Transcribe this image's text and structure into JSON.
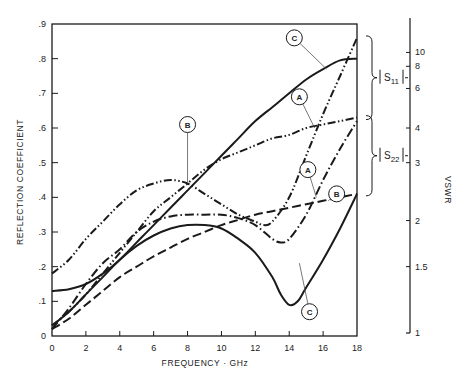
{
  "chart_data": {
    "type": "line",
    "title": "",
    "xlabel": "FREQUENCY · GHz",
    "ylabel": "REFLECTION COEFFICIENT",
    "y2label": "VSWR",
    "xlim": [
      0,
      18
    ],
    "ylim": [
      0,
      0.9
    ],
    "grid": false,
    "x_ticks": [
      0,
      2,
      4,
      6,
      8,
      10,
      12,
      14,
      16,
      18
    ],
    "x_tick_labels": [
      "0",
      "2",
      "4",
      "6",
      "8",
      "10",
      "12",
      "14",
      "16",
      "18"
    ],
    "y_ticks": [
      0,
      0.1,
      0.2,
      0.3,
      0.4,
      0.5,
      0.6,
      0.7,
      0.8,
      0.9
    ],
    "y_tick_labels": [
      "0",
      ".1",
      ".2",
      ".3",
      ".4",
      ".5",
      ".6",
      ".7",
      ".8",
      ".9"
    ],
    "y2_ticks": [
      {
        "label": "10",
        "rc": 0.818
      },
      {
        "label": "8",
        "rc": 0.778
      },
      {
        "label": "6",
        "rc": 0.714
      },
      {
        "label": "4",
        "rc": 0.6
      },
      {
        "label": "3",
        "rc": 0.5
      },
      {
        "label": "2",
        "rc": 0.333
      },
      {
        "label": "1.5",
        "rc": 0.2
      },
      {
        "label": "1",
        "rc": 0.0
      }
    ],
    "brackets": [
      {
        "label": "|S11|",
        "sub": "11",
        "from_rc": 0.86,
        "to_rc": 0.63
      },
      {
        "label": "|S22|",
        "sub": "22",
        "from_rc": 0.63,
        "to_rc": 0.41
      }
    ],
    "series": [
      {
        "name": "A |S11|",
        "style": "dash-dot-dot",
        "x": [
          0,
          1,
          2,
          3,
          4,
          5,
          6,
          7,
          8,
          9,
          10,
          11,
          12,
          12.5,
          13,
          14,
          15,
          16,
          17,
          18
        ],
        "values": [
          0.18,
          0.22,
          0.28,
          0.33,
          0.38,
          0.42,
          0.44,
          0.45,
          0.44,
          0.41,
          0.38,
          0.35,
          0.33,
          0.32,
          0.33,
          0.4,
          0.52,
          0.64,
          0.75,
          0.86
        ]
      },
      {
        "name": "B |S11|",
        "style": "dash-dot-dot",
        "x": [
          0,
          1,
          2,
          3,
          4,
          5,
          6,
          7,
          8,
          9,
          10,
          11,
          12,
          13,
          14,
          15,
          16,
          17,
          18
        ],
        "values": [
          0.03,
          0.07,
          0.12,
          0.18,
          0.24,
          0.3,
          0.36,
          0.4,
          0.44,
          0.48,
          0.51,
          0.53,
          0.55,
          0.57,
          0.58,
          0.6,
          0.61,
          0.62,
          0.63
        ]
      },
      {
        "name": "C |S11|",
        "style": "solid",
        "x": [
          0,
          1,
          2,
          3,
          4,
          5,
          6,
          7,
          8,
          9,
          10,
          11,
          12,
          13,
          14,
          15,
          16,
          17,
          18
        ],
        "values": [
          0.13,
          0.135,
          0.15,
          0.18,
          0.22,
          0.27,
          0.32,
          0.37,
          0.42,
          0.47,
          0.52,
          0.57,
          0.62,
          0.66,
          0.7,
          0.74,
          0.77,
          0.795,
          0.8
        ]
      },
      {
        "name": "A |S22|",
        "style": "dash-dot",
        "x": [
          0,
          1,
          2,
          3,
          4,
          5,
          6,
          7,
          8,
          9,
          10,
          11,
          12,
          13,
          13.5,
          14,
          15,
          16,
          17,
          18
        ],
        "values": [
          0.02,
          0.08,
          0.15,
          0.21,
          0.25,
          0.3,
          0.33,
          0.345,
          0.35,
          0.35,
          0.35,
          0.34,
          0.32,
          0.28,
          0.27,
          0.28,
          0.35,
          0.45,
          0.54,
          0.62
        ]
      },
      {
        "name": "B |S22|",
        "style": "dashed",
        "x": [
          0,
          1,
          2,
          3,
          4,
          5,
          6,
          7,
          8,
          9,
          10,
          11,
          12,
          13,
          14,
          15,
          16,
          17,
          18
        ],
        "values": [
          0.02,
          0.05,
          0.09,
          0.13,
          0.17,
          0.2,
          0.23,
          0.255,
          0.28,
          0.3,
          0.32,
          0.335,
          0.35,
          0.36,
          0.37,
          0.38,
          0.39,
          0.4,
          0.41
        ]
      },
      {
        "name": "C |S22|",
        "style": "solid",
        "x": [
          0,
          1,
          2,
          3,
          4,
          5,
          6,
          7,
          8,
          9,
          10,
          11,
          12,
          13,
          13.5,
          14,
          14.5,
          15,
          16,
          17,
          18
        ],
        "values": [
          0.03,
          0.07,
          0.12,
          0.17,
          0.22,
          0.26,
          0.29,
          0.31,
          0.32,
          0.32,
          0.31,
          0.28,
          0.24,
          0.17,
          0.12,
          0.09,
          0.1,
          0.14,
          0.22,
          0.31,
          0.41
        ]
      }
    ],
    "annotations": [
      {
        "label": "C",
        "circle_x": 14.3,
        "circle_rc": 0.86,
        "target_x": 16.2,
        "target_rc": 0.77
      },
      {
        "label": "A",
        "circle_x": 14.6,
        "circle_rc": 0.69,
        "target_x": 15.5,
        "target_rc": 0.6
      },
      {
        "label": "B",
        "circle_x": 8.0,
        "circle_rc": 0.61,
        "target_x": 8.0,
        "target_rc": 0.44
      },
      {
        "label": "A",
        "circle_x": 15.1,
        "circle_rc": 0.48,
        "target_x": 15.6,
        "target_rc": 0.4
      },
      {
        "label": "B",
        "circle_x": 16.8,
        "circle_rc": 0.41,
        "target_x": 16.3,
        "target_rc": 0.39
      },
      {
        "label": "C",
        "circle_x": 15.2,
        "circle_rc": 0.07,
        "target_x": 14.6,
        "target_rc": 0.21
      }
    ]
  }
}
